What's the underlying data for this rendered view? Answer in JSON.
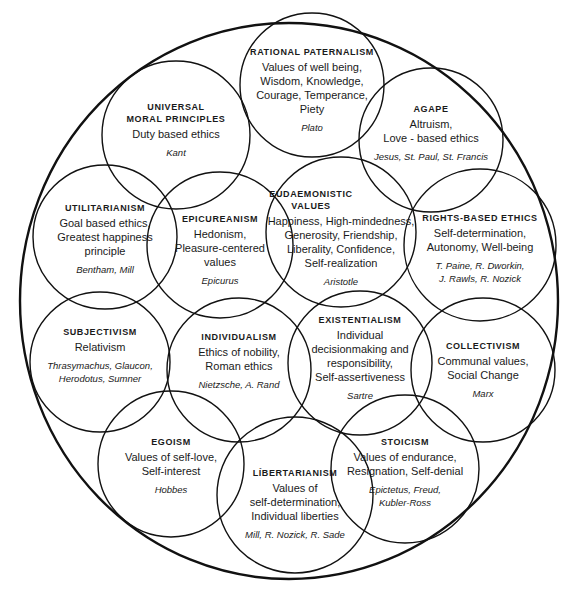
{
  "diagram": {
    "stroke_color": "#111111",
    "background": "#ffffff",
    "concepts": [
      {
        "id": "rational-paternalism",
        "title": [
          "RATIONAL PATERNALISM"
        ],
        "desc": [
          "Values of well being,",
          "Wisdom, Knowledge,",
          "Courage, Temperance,",
          "Piety"
        ],
        "people": [
          "Plato"
        ]
      },
      {
        "id": "universal-moral-principles",
        "title": [
          "UNIVERSAL",
          "MORAL PRINCIPLES"
        ],
        "desc": [
          "Duty based ethics"
        ],
        "people": [
          "Kant"
        ]
      },
      {
        "id": "agape",
        "title": [
          "AGAPE"
        ],
        "desc": [
          "Altruism,",
          "Love - based ethics"
        ],
        "people": [
          "Jesus, St. Paul, St. Francis"
        ]
      },
      {
        "id": "utilitarianism",
        "title": [
          "UTILITARIANISM"
        ],
        "desc": [
          "Goal based ethics,",
          "Greatest happiness",
          "principle"
        ],
        "people": [
          "Bentham, Mill"
        ]
      },
      {
        "id": "epicureanism",
        "title": [
          "EPICUREANISM"
        ],
        "desc": [
          "Hedonism,",
          "Pleasure-centered",
          "values"
        ],
        "people": [
          "Epicurus"
        ]
      },
      {
        "id": "eudaemonistic-values",
        "title": [
          "EUDAEMONISTIC",
          "VALUES"
        ],
        "desc": [
          "Happiness, High-mindedness,",
          "Generosity, Friendship,",
          "Liberality, Confidence,",
          "Self-realization"
        ],
        "people": [
          "Aristotle"
        ]
      },
      {
        "id": "rights-based-ethics",
        "title": [
          "RIGHTS-BASED ETHICS"
        ],
        "desc": [
          "Self-determination,",
          "Autonomy, Well-being"
        ],
        "people": [
          "T. Paine, R. Dworkin,",
          "J. Rawls, R. Nozick"
        ]
      },
      {
        "id": "subjectivism",
        "title": [
          "SUBJECTIVISM"
        ],
        "desc": [
          "Relativism"
        ],
        "people": [
          "Thrasymachus, Glaucon,",
          "Herodotus, Sumner"
        ]
      },
      {
        "id": "individualism",
        "title": [
          "INDIVIDUALISM"
        ],
        "desc": [
          "Ethics of nobility,",
          "Roman ethics"
        ],
        "people": [
          "Nietzsche, A. Rand"
        ]
      },
      {
        "id": "existentialism",
        "title": [
          "EXISTENTIALISM"
        ],
        "desc": [
          "Individual",
          "decisionmaking and",
          "responsibility,",
          "Self-assertiveness"
        ],
        "people": [
          "Sartre"
        ]
      },
      {
        "id": "collectivism",
        "title": [
          "COLLECTIVISM"
        ],
        "desc": [
          "Communal values,",
          "Social Change"
        ],
        "people": [
          "Marx"
        ]
      },
      {
        "id": "egoism",
        "title": [
          "EGOISM"
        ],
        "desc": [
          "Values of self-love,",
          "Self-interest"
        ],
        "people": [
          "Hobbes"
        ]
      },
      {
        "id": "libertarianism",
        "title": [
          "LÍBERTARIANISM"
        ],
        "desc": [
          "Values of",
          "self-determination,",
          "Individual liberties"
        ],
        "people": [
          "Mill, R. Nozick, R. Sade"
        ]
      },
      {
        "id": "stoicism",
        "title": [
          "STOICISM"
        ],
        "desc": [
          "Values of endurance,",
          "Resignation, Self-denial"
        ],
        "people": [
          "Epictetus, Freud,",
          "Kubler-Ross"
        ]
      }
    ]
  }
}
